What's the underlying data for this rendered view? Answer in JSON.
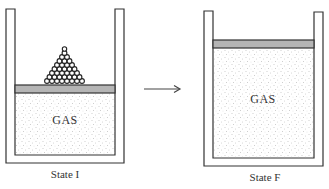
{
  "diagram": {
    "type": "thermodynamics-piston-cylinder",
    "states": [
      {
        "id": "initial",
        "label": "State I",
        "gas_label": "GAS",
        "piston": "low position with pile of weights (balls) on top"
      },
      {
        "id": "final",
        "label": "State F",
        "gas_label": "GAS",
        "piston": "high position, no weights"
      }
    ],
    "arrow": "right-arrow from State I to State F",
    "colors": {
      "outline": "#333333",
      "piston_fill": "#b5b5b5",
      "gas_dots": "#9a9a9a",
      "background": "#ffffff"
    }
  }
}
